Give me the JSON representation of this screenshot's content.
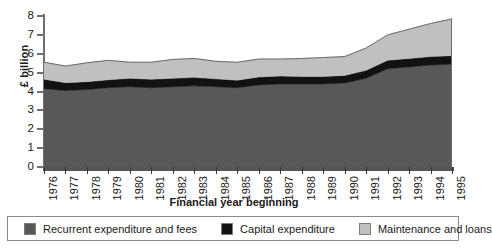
{
  "chart_data": {
    "type": "area",
    "stacked": true,
    "title": "",
    "xlabel": "Financial year beginning",
    "ylabel": "£ billion",
    "ylim": [
      0,
      8
    ],
    "yticks": [
      0,
      1,
      2,
      3,
      4,
      5,
      6,
      7,
      8
    ],
    "grid": false,
    "legend_position": "bottom",
    "categories": [
      "1976",
      "1977",
      "1978",
      "1979",
      "1980",
      "1981",
      "1982",
      "1983",
      "1984",
      "1985",
      "1986",
      "1987",
      "1988",
      "1989",
      "1990",
      "1991",
      "1992",
      "1993",
      "1994",
      "1995"
    ],
    "series": [
      {
        "name": "Recurrent expenditure and fees",
        "color": "#585858",
        "values": [
          4.15,
          4.05,
          4.1,
          4.2,
          4.25,
          4.2,
          4.25,
          4.3,
          4.25,
          4.2,
          4.35,
          4.4,
          4.4,
          4.4,
          4.45,
          4.7,
          5.2,
          5.3,
          5.4,
          5.45
        ]
      },
      {
        "name": "Capital expenditure",
        "color": "#121212",
        "values": [
          0.5,
          0.42,
          0.42,
          0.42,
          0.45,
          0.45,
          0.45,
          0.45,
          0.42,
          0.4,
          0.42,
          0.42,
          0.4,
          0.4,
          0.4,
          0.42,
          0.45,
          0.45,
          0.45,
          0.45
        ]
      },
      {
        "name": "Maintenance and loans",
        "color": "#c0c0c0",
        "values": [
          0.9,
          0.88,
          1.0,
          1.03,
          0.85,
          0.9,
          1.0,
          1.0,
          0.93,
          0.95,
          0.95,
          0.9,
          0.95,
          1.0,
          1.0,
          1.18,
          1.35,
          1.55,
          1.75,
          1.95
        ]
      }
    ],
    "totals": [
      5.55,
      5.35,
      5.52,
      5.65,
      5.55,
      5.55,
      5.7,
      5.75,
      5.6,
      5.55,
      5.72,
      5.72,
      5.75,
      5.8,
      5.85,
      6.3,
      7.0,
      7.3,
      7.6,
      7.85
    ]
  },
  "legend": {
    "items": [
      {
        "label": "Recurrent expenditure and fees",
        "color": "#585858"
      },
      {
        "label": "Capital expenditure",
        "color": "#121212"
      },
      {
        "label": "Maintenance and loans",
        "color": "#c0c0c0"
      }
    ]
  }
}
